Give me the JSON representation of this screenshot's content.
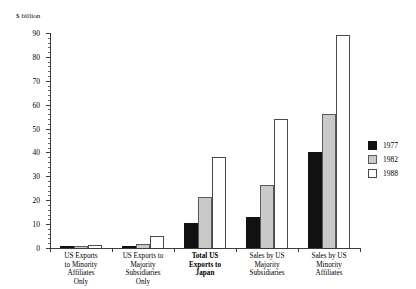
{
  "chart_data": {
    "type": "bar",
    "title": "",
    "subtitle": "",
    "xlabel": "",
    "ylabel": "$ billion",
    "ylim": [
      0,
      90
    ],
    "y_ticks": [
      0,
      10,
      20,
      30,
      40,
      50,
      60,
      70,
      80,
      90
    ],
    "y_tick_labels": [
      "0",
      "10",
      "20",
      "30",
      "40",
      "50",
      "60",
      "70",
      "80",
      "90"
    ],
    "y_minor_tick_step": 2,
    "grid": false,
    "legend_position": "right",
    "categories": [
      "US Exports\nto Minority\nAffiliates\nOnly",
      "US Exports to\nMajority\nSubsidiaries\nOnly",
      "Total US\nExports to\nJapan",
      "Sales by US\nMajority\nSubsidiaries",
      "Sales by US\nMinority\nAffiliates"
    ],
    "emphasized_category_index": 2,
    "series": [
      {
        "name": "1977",
        "color": "#111111",
        "values": [
          0.8,
          1.0,
          10.5,
          13.0,
          40.0
        ]
      },
      {
        "name": "1982",
        "color": "#c9c9c9",
        "values": [
          1.0,
          1.6,
          21.5,
          26.5,
          56.0
        ]
      },
      {
        "name": "1988",
        "color": "#ffffff",
        "values": [
          1.4,
          5.2,
          38.0,
          54.0,
          89.0
        ]
      }
    ],
    "legend_entries": [
      "1977",
      "1982",
      "1988"
    ]
  }
}
